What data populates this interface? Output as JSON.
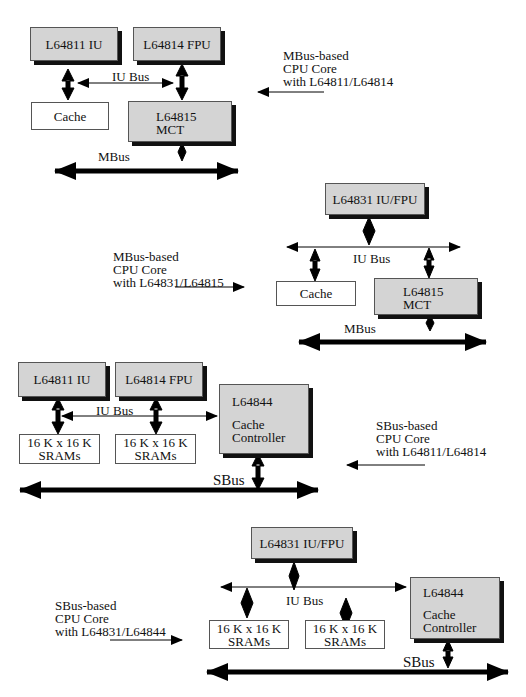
{
  "diagrams": [
    {
      "title": "MBus-based CPU Core with L64811/L64814",
      "caption": [
        "MBus-based",
        "CPU Core",
        "with L64811/L64814"
      ],
      "blocks": {
        "iu": "L64811 IU",
        "fpu": "L64814 FPU",
        "cache": "Cache",
        "mct": [
          "L64815",
          "MCT"
        ]
      },
      "buses": {
        "local": "IU Bus",
        "system": "MBus"
      }
    },
    {
      "title": "MBus-based CPU Core with L64831/L64815",
      "caption": [
        "MBus-based",
        "CPU Core",
        "with L64831/L64815"
      ],
      "blocks": {
        "iufpu": "L64831 IU/FPU",
        "cache": "Cache",
        "mct": [
          "L64815",
          "MCT"
        ]
      },
      "buses": {
        "local": "IU Bus",
        "system": "MBus"
      }
    },
    {
      "title": "SBus-based CPU Core with L64811/L64814",
      "caption": [
        "SBus-based",
        "CPU Core",
        "with L64811/L64814"
      ],
      "blocks": {
        "iu": "L64811 IU",
        "fpu": "L64814 FPU",
        "sram1": [
          "16 K x 16 K",
          "SRAMs"
        ],
        "sram2": [
          "16 K x 16 K",
          "SRAMs"
        ],
        "cc": [
          "L64844",
          "Cache",
          "Controller"
        ]
      },
      "buses": {
        "local": "IU Bus",
        "system": "SBus"
      }
    },
    {
      "title": "SBus-based CPU Core with L64831/L64844",
      "caption": [
        "SBus-based",
        "CPU Core",
        "with L64831/L64844"
      ],
      "blocks": {
        "iufpu": "L64831 IU/FPU",
        "sram1": [
          "16 K x 16 K",
          "SRAMs"
        ],
        "sram2": [
          "16 K x 16 K",
          "SRAMs"
        ],
        "cc": [
          "L64844",
          "Cache",
          "Controller"
        ]
      },
      "buses": {
        "local": "IU Bus",
        "system": "SBus"
      }
    }
  ],
  "colors": {
    "chip_fill": "#d4d4d4",
    "shadow": "#111111",
    "line": "#000000"
  }
}
